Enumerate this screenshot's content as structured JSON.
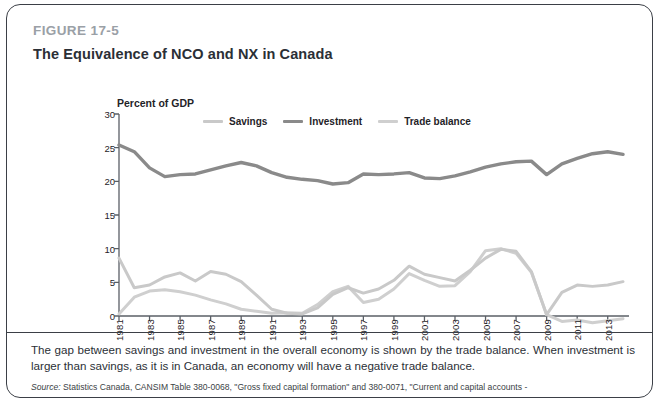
{
  "figure": {
    "label": "FIGURE 17-5",
    "title": "The Equivalence of NCO and NX in Canada"
  },
  "caption": "The gap between savings and investment in the overall economy is shown by the trade balance. When investment is larger than savings, as it is in Canada, an economy will have a negative trade balance.",
  "source_prefix": "Source:",
  "source_text": " Statistics Canada, CANSIM Table 380-0068, \"Gross fixed capital formation\" and 380-0071, \"Current and capital accounts -",
  "colors": {
    "savings": "#c9c9c9",
    "investment": "#8a8a8a",
    "trade_balance": "#cfcfcf",
    "axis": "#5a5f66",
    "text": "#1f2328",
    "figure_label": "#9aa0a6",
    "border": "#3b3f46"
  },
  "chart_data": {
    "type": "line",
    "title": "The Equivalence of NCO and NX in Canada",
    "ylabel": "Percent of GDP",
    "xlabel": "",
    "ylim": [
      0,
      30
    ],
    "yticks": [
      0,
      5,
      10,
      15,
      20,
      25,
      30
    ],
    "ytick_labels": [
      "0",
      "5",
      "10",
      "15",
      "20",
      "25",
      "30"
    ],
    "grid": false,
    "legend_position": "top-center",
    "x": [
      1981,
      1982,
      1983,
      1984,
      1985,
      1986,
      1987,
      1988,
      1989,
      1990,
      1991,
      1992,
      1993,
      1994,
      1995,
      1996,
      1997,
      1998,
      1999,
      2000,
      2001,
      2002,
      2003,
      2004,
      2005,
      2006,
      2007,
      2008,
      2009,
      2010,
      2011,
      2012,
      2013,
      2014
    ],
    "xtick_labels": [
      "1981",
      "1983",
      "1985",
      "1987",
      "1989",
      "1991",
      "1993",
      "1995",
      "1997",
      "1999",
      "2001",
      "2003",
      "2005",
      "2007",
      "2009",
      "2011",
      "2013"
    ],
    "series": [
      {
        "name": "Savings",
        "color": "#c9c9c9",
        "values": [
          8.6,
          4.2,
          4.6,
          5.8,
          6.4,
          5.2,
          6.6,
          6.2,
          5.1,
          3.1,
          1.0,
          0.4,
          0.3,
          1.2,
          3.2,
          4.2,
          3.4,
          4.0,
          5.3,
          7.4,
          6.2,
          5.7,
          5.2,
          6.8,
          8.6,
          9.9,
          9.6,
          6.6,
          0.2,
          3.5,
          4.6,
          4.4,
          4.6,
          5.1
        ]
      },
      {
        "name": "Investment",
        "color": "#8a8a8a",
        "values": [
          25.4,
          24.4,
          22.0,
          20.7,
          21.0,
          21.1,
          21.7,
          22.3,
          22.8,
          22.3,
          21.3,
          20.6,
          20.3,
          20.1,
          19.6,
          19.8,
          21.1,
          21.0,
          21.1,
          21.3,
          20.5,
          20.4,
          20.8,
          21.4,
          22.1,
          22.6,
          22.9,
          23.0,
          21.0,
          22.6,
          23.4,
          24.1,
          24.4,
          24.0
        ]
      },
      {
        "name": "Trade balance",
        "color": "#cfcfcf",
        "values": [
          0.3,
          2.8,
          3.7,
          3.9,
          3.6,
          3.1,
          2.4,
          1.8,
          1.0,
          0.7,
          0.4,
          0.5,
          0.4,
          1.7,
          3.6,
          4.4,
          2.0,
          2.5,
          4.0,
          6.3,
          5.3,
          4.4,
          4.5,
          6.6,
          9.7,
          10.0,
          9.3,
          6.5,
          0.2,
          -0.8,
          -0.6,
          -1.0,
          -0.7,
          -0.4
        ]
      }
    ]
  }
}
